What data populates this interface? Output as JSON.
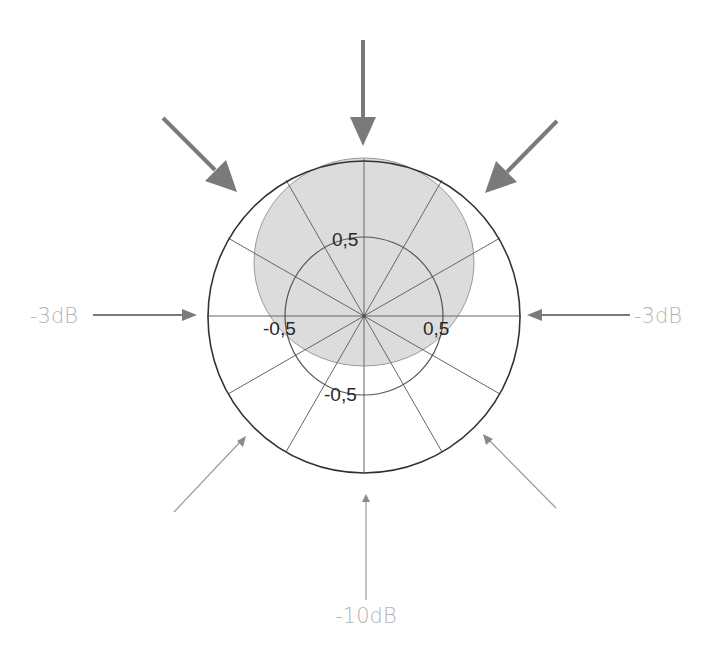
{
  "diagram": {
    "type": "polar-pickup-pattern",
    "pattern": "cardioid",
    "colors": {
      "background": "#ffffff",
      "pattern_fill": "#dcdcdc",
      "pattern_stroke": "#9a9a9a",
      "grid_outer": "#333333",
      "grid_inner": "#555555",
      "spokes": "#666666",
      "arrow_strong": "#7a7a7a",
      "arrow_weak": "#9a9a9a",
      "db_label": "#b4b4b4",
      "scale_label": "#2a2a2a"
    },
    "scale_labels": {
      "top": "0,5",
      "left": "-0,5",
      "right": "0,5",
      "bottom": "-0,5"
    },
    "attenuation_labels": {
      "left": "-3dB",
      "right": "-3dB",
      "bottom": "-10dB"
    },
    "spoke_angles_deg": [
      0,
      30,
      60,
      90,
      120,
      150,
      180,
      210,
      240,
      270,
      300,
      330
    ],
    "arrows": {
      "strong": [
        "top",
        "top-left",
        "top-right"
      ],
      "medium": [
        "left",
        "right"
      ],
      "weak": [
        "bottom-left",
        "bottom",
        "bottom-right"
      ]
    }
  }
}
